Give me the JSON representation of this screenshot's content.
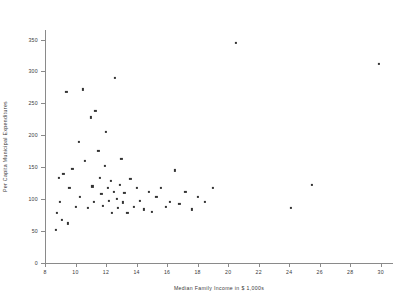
{
  "chart_data": {
    "type": "scatter",
    "title": "",
    "xlabel": "Median Family Income in $ 1,000s",
    "ylabel": "Per Capita Municipal Expenditures",
    "xlim": [
      8,
      30.8
    ],
    "ylim": [
      0,
      365
    ],
    "xticks": [
      8,
      10,
      12,
      14,
      16,
      18,
      20,
      22,
      24,
      26,
      28,
      30
    ],
    "yticks": [
      0,
      50,
      100,
      150,
      200,
      250,
      300,
      350
    ],
    "grid": false,
    "legend": null,
    "marker": "square",
    "marker_color": "#333333",
    "points": [
      [
        8.7,
        52
      ],
      [
        8.8,
        78
      ],
      [
        8.9,
        133
      ],
      [
        9.0,
        96
      ],
      [
        9.1,
        68
      ],
      [
        9.2,
        140
      ],
      [
        9.4,
        268
      ],
      [
        9.5,
        62
      ],
      [
        9.6,
        118
      ],
      [
        9.8,
        148
      ],
      [
        10.0,
        88
      ],
      [
        10.2,
        190
      ],
      [
        10.3,
        104
      ],
      [
        10.5,
        272
      ],
      [
        10.6,
        160
      ],
      [
        10.8,
        86
      ],
      [
        11.0,
        228
      ],
      [
        11.1,
        120
      ],
      [
        11.2,
        96
      ],
      [
        11.3,
        238
      ],
      [
        11.5,
        176
      ],
      [
        11.6,
        133
      ],
      [
        11.7,
        108
      ],
      [
        11.8,
        90
      ],
      [
        11.9,
        152
      ],
      [
        12.0,
        205
      ],
      [
        12.1,
        118
      ],
      [
        12.2,
        97
      ],
      [
        12.3,
        128
      ],
      [
        12.4,
        78
      ],
      [
        12.5,
        112
      ],
      [
        12.6,
        290
      ],
      [
        12.7,
        100
      ],
      [
        12.8,
        86
      ],
      [
        12.9,
        122
      ],
      [
        13.0,
        163
      ],
      [
        13.1,
        95
      ],
      [
        13.2,
        110
      ],
      [
        13.4,
        78
      ],
      [
        13.6,
        132
      ],
      [
        13.8,
        88
      ],
      [
        14.0,
        118
      ],
      [
        14.2,
        97
      ],
      [
        14.5,
        84
      ],
      [
        14.8,
        112
      ],
      [
        15.0,
        80
      ],
      [
        15.3,
        104
      ],
      [
        15.6,
        118
      ],
      [
        15.9,
        88
      ],
      [
        16.2,
        96
      ],
      [
        16.5,
        145
      ],
      [
        16.8,
        92
      ],
      [
        17.2,
        112
      ],
      [
        17.6,
        84
      ],
      [
        18.0,
        104
      ],
      [
        18.5,
        96
      ],
      [
        19.0,
        118
      ],
      [
        20.5,
        345
      ],
      [
        24.1,
        86
      ],
      [
        25.5,
        122
      ],
      [
        29.9,
        312
      ]
    ]
  }
}
